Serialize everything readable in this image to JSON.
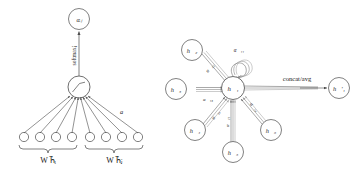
{
  "figure": {
    "name": "gat-attention-and-multihead-diagram",
    "stroke_color": "#4a4a4a",
    "text_color": "#1a1a1a",
    "background_color": "#ffffff",
    "multihead_colors": [
      "#6f6f6f",
      "#8c8c8c",
      "#a9a9a9"
    ]
  },
  "left_panel": {
    "name": "attention-mechanism",
    "output_node_label": "αᵢⱼ",
    "softmax_label": "softmaxⱼ",
    "activation_node_label": "LeakyReLU-slope",
    "attention_vector_label": "a⃗",
    "brace_left_label": "W h⃗ᵢ",
    "brace_right_label": "W h⃗ⱼ",
    "input_units_left": 4,
    "input_units_right": 4
  },
  "right_panel": {
    "name": "multi-head-attention",
    "center_node": "h⃗₁",
    "output_node": "h⃗′₁",
    "concat_label": "concat/avg",
    "neighbors": [
      {
        "id": "h2",
        "label": "h⃗₂",
        "alpha": "α⃗₁₂"
      },
      {
        "id": "h3",
        "label": "h⃗₃",
        "alpha": "α⃗₁₃"
      },
      {
        "id": "h4",
        "label": "h⃗₄",
        "alpha": "α⃗₁₄"
      },
      {
        "id": "h5",
        "label": "h⃗₅",
        "alpha": "α⃗₁₅"
      },
      {
        "id": "h6",
        "label": "h⃗₆",
        "alpha": "α⃗₁₆"
      }
    ],
    "self_loop_alpha": "α⃗₁₁",
    "num_heads": 3
  }
}
